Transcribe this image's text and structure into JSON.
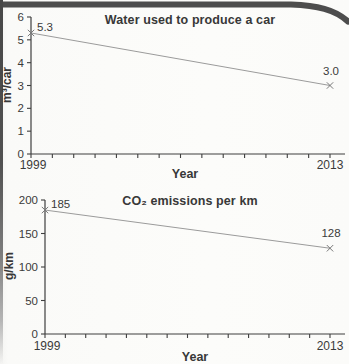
{
  "theme": {
    "paper_color": "#fbfbf9",
    "edge_band_color": "#4d4d4d",
    "axis_color": "#3f3f3f",
    "text_color": "#3a3a3a"
  },
  "chart_data": [
    {
      "type": "line",
      "title": "Water used to produce a car",
      "ylabel": "m³/car",
      "xlabel": "Year",
      "x": [
        1999,
        2013
      ],
      "values": [
        5.3,
        3.0
      ],
      "point_labels": [
        "5.3",
        "3.0"
      ],
      "ylim": [
        0,
        6
      ],
      "yticks": [
        0,
        1,
        2,
        3,
        4,
        5,
        6
      ],
      "ytick_labels": [
        "0",
        "1",
        "2",
        "3",
        "4",
        "5",
        "6"
      ],
      "xtick_labels": [
        "1999",
        "2013"
      ],
      "minor_xticks": "one per year 1999-2013",
      "legend": "none",
      "grid": false,
      "line_color": "#9b9b9b",
      "marker": "x",
      "marker_color": "#787878"
    },
    {
      "type": "line",
      "title": "CO₂ emissions per km",
      "ylabel": "g/km",
      "xlabel": "Year",
      "x": [
        1999,
        2013
      ],
      "values": [
        185,
        128
      ],
      "point_labels": [
        "185",
        "128"
      ],
      "ylim": [
        0,
        200
      ],
      "yticks": [
        0,
        50,
        100,
        150,
        200
      ],
      "ytick_labels": [
        "0",
        "50",
        "100",
        "150",
        "200"
      ],
      "xtick_labels": [
        "1999",
        "2013"
      ],
      "minor_xticks": "one per year 1999-2013",
      "legend": "none",
      "grid": false,
      "line_color": "#9b9b9b",
      "marker": "x",
      "marker_color": "#787878"
    }
  ]
}
